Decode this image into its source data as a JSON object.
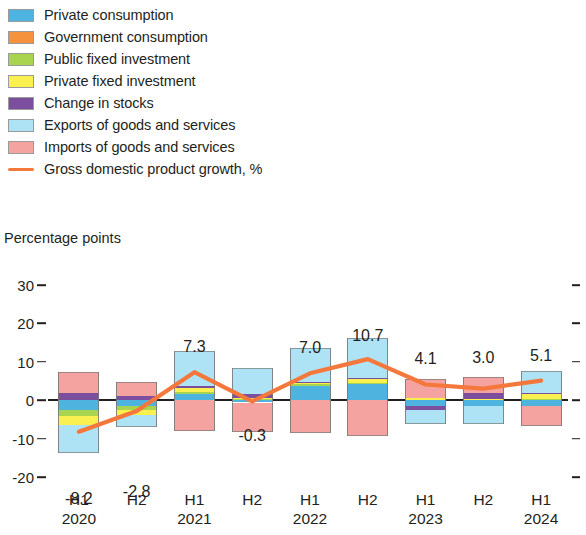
{
  "legend": {
    "items": [
      {
        "label": "Private consumption",
        "color": "#4FB3E0",
        "type": "swatch",
        "key": "private_consumption"
      },
      {
        "label": "Government consumption",
        "color": "#F4923D",
        "type": "swatch",
        "key": "government_consumption"
      },
      {
        "label": "Public fixed investment",
        "color": "#A8D44F",
        "type": "swatch",
        "key": "public_fixed_investment"
      },
      {
        "label": "Private fixed investment",
        "color": "#FAF04F",
        "type": "swatch",
        "key": "private_fixed_investment"
      },
      {
        "label": "Change in stocks",
        "color": "#7B4E9E",
        "type": "swatch",
        "key": "change_in_stocks"
      },
      {
        "label": "Exports of goods and services",
        "color": "#AEE3F5",
        "type": "swatch",
        "key": "exports"
      },
      {
        "label": "Imports of goods and services",
        "color": "#F5A3A0",
        "type": "swatch",
        "key": "imports"
      },
      {
        "label": "Gross domestic product growth, %",
        "color": "#F4773C",
        "type": "line",
        "key": "gdp_growth"
      }
    ]
  },
  "axis_title": "Percentage points",
  "chart_data": {
    "type": "bar",
    "title": "",
    "subtitle": "",
    "xlabel": "",
    "ylabel": "Percentage points",
    "ylim": [
      -20,
      30
    ],
    "yticks": [
      30,
      20,
      10,
      0,
      -10,
      -20
    ],
    "grid": false,
    "legend_position": "top-left",
    "stacked": true,
    "categories": [
      "H1 2020",
      "H2 2020",
      "H1 2021",
      "H2 2021",
      "H1 2022",
      "H2 2022",
      "H1 2023",
      "H2 2023",
      "H1 2024"
    ],
    "period_labels": [
      "H1",
      "H2",
      "H1",
      "H2",
      "H1",
      "H2",
      "H1",
      "H2",
      "H1"
    ],
    "year_labels": [
      "2020",
      "",
      "2021",
      "",
      "2022",
      "",
      "2023",
      "",
      "2024"
    ],
    "series": [
      {
        "name": "Private consumption",
        "color": "#4FB3E0",
        "values": [
          -2.6,
          -1.6,
          1.6,
          -0.6,
          3.8,
          4.2,
          -1.5,
          -1.4,
          -1.6
        ]
      },
      {
        "name": "Government consumption",
        "color": "#F4923D",
        "values": [
          0.0,
          0.0,
          0.0,
          0.0,
          0.0,
          0.0,
          0.0,
          0.0,
          0.0
        ]
      },
      {
        "name": "Public fixed investment",
        "color": "#A8D44F",
        "values": [
          -1.5,
          -0.9,
          0.5,
          0.4,
          0.3,
          0.3,
          0.1,
          0.1,
          0.2
        ]
      },
      {
        "name": "Private fixed investment",
        "color": "#FAF04F",
        "values": [
          -2.4,
          -1.3,
          1.0,
          0.1,
          0.4,
          1.0,
          0.5,
          0.1,
          1.5
        ]
      },
      {
        "name": "Change in stocks",
        "color": "#7B4E9E",
        "values": [
          1.9,
          1.2,
          0.5,
          1.0,
          0.3,
          0.3,
          -1.1,
          1.6,
          0.3
        ]
      },
      {
        "name": "Exports of goods and services",
        "color": "#AEE3F5",
        "values": [
          -7.3,
          -3.1,
          9.1,
          7.0,
          8.8,
          10.4,
          -3.6,
          -4.7,
          5.6
        ]
      },
      {
        "name": "Imports of goods and services",
        "color": "#F5A3A0",
        "values": [
          5.5,
          3.5,
          -8.0,
          -7.7,
          -8.5,
          -9.3,
          4.9,
          4.3,
          -5.0
        ]
      }
    ],
    "line_series": {
      "name": "Gross domestic product growth, %",
      "color": "#F4773C",
      "values": [
        -8.2,
        -2.8,
        7.3,
        -0.3,
        7.0,
        10.7,
        4.1,
        3.0,
        5.1
      ],
      "labels": [
        "-8.2",
        "-2.8",
        "7.3",
        "-0.3",
        "7.0",
        "10.7",
        "4.1",
        "3.0",
        "5.1"
      ]
    }
  }
}
